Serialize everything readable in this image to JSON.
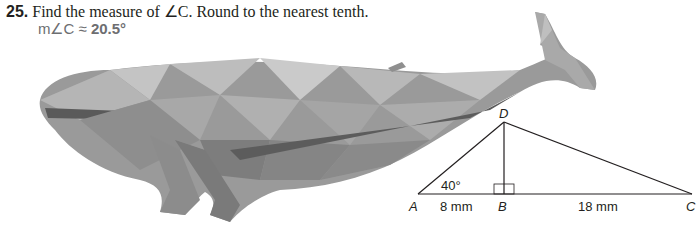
{
  "problem": {
    "number": "25.",
    "prompt": "Find the measure of ∠C. Round to the nearest tenth.",
    "answer_prefix": "m∠C ≈ ",
    "answer_value": "20.5°"
  },
  "figure": {
    "image": "low-poly-whale-icon",
    "triangle": {
      "vertices": [
        "A",
        "B",
        "C",
        "D"
      ],
      "angle_A": "40°",
      "segment_AB": "8 mm",
      "segment_BC": "18 mm",
      "right_angle_at": "B"
    }
  }
}
